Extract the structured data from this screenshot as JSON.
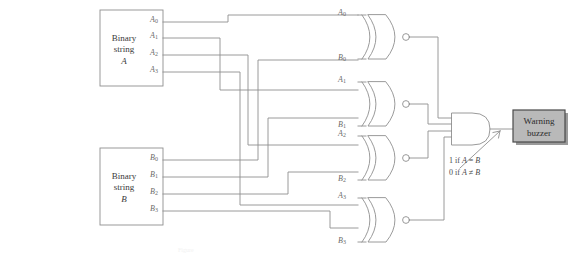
{
  "diagram": {
    "background": "#ffffff",
    "wire_color": "#8a8a8a",
    "box_border": "#8f8f8f",
    "buzzer_fill": "#b9b9b9",
    "buzzer_border": "#4a4a4a"
  },
  "input_a": {
    "line1": "Binary",
    "line2": "string",
    "line3": "A",
    "ports": [
      {
        "name": "A0",
        "base": "A",
        "sub": "0"
      },
      {
        "name": "A1",
        "base": "A",
        "sub": "1"
      },
      {
        "name": "A2",
        "base": "A",
        "sub": "2"
      },
      {
        "name": "A3",
        "base": "A",
        "sub": "3"
      }
    ]
  },
  "input_b": {
    "line1": "Binary",
    "line2": "string",
    "line3": "B",
    "ports": [
      {
        "name": "B0",
        "base": "B",
        "sub": "0"
      },
      {
        "name": "B1",
        "base": "B",
        "sub": "1"
      },
      {
        "name": "B2",
        "base": "B",
        "sub": "2"
      },
      {
        "name": "B3",
        "base": "B",
        "sub": "3"
      }
    ]
  },
  "xnor_gates": [
    {
      "id": "xnor-0",
      "type": "XNOR",
      "input_top": "A0",
      "input_bottom": "B0",
      "top_base": "A",
      "top_sub": "0",
      "bot_base": "B",
      "bot_sub": "0"
    },
    {
      "id": "xnor-1",
      "type": "XNOR",
      "input_top": "A1",
      "input_bottom": "B1",
      "top_base": "A",
      "top_sub": "1",
      "bot_base": "B",
      "bot_sub": "1"
    },
    {
      "id": "xnor-2",
      "type": "XNOR",
      "input_top": "A2",
      "input_bottom": "B2",
      "top_base": "A",
      "top_sub": "2",
      "bot_base": "B",
      "bot_sub": "2"
    },
    {
      "id": "xnor-3",
      "type": "XNOR",
      "input_top": "A3",
      "input_bottom": "B3",
      "top_base": "A",
      "top_sub": "3",
      "bot_base": "B",
      "bot_sub": "3"
    }
  ],
  "and_gate": {
    "type": "AND",
    "inputs": 4,
    "annotation_line1_prefix": "1 if ",
    "annotation_line1_a": "A",
    "annotation_line1_op": " = ",
    "annotation_line1_b": "B",
    "annotation_line2_prefix": "0 if ",
    "annotation_line2_a": "A",
    "annotation_line2_op": " ≠ ",
    "annotation_line2_b": "B"
  },
  "output": {
    "line1": "Warning",
    "line2": "buzzer"
  },
  "caption": "Figure"
}
